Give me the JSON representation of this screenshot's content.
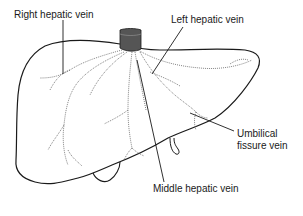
{
  "diagram": {
    "labels": {
      "right_hepatic_vein": "Right hepatic vein",
      "left_hepatic_vein": "Left hepatic vein",
      "umbilical_fissure_vein_line1": "Umbilical",
      "umbilical_fissure_vein_line2": "fissure vein",
      "middle_hepatic_vein": "Middle hepatic vein"
    },
    "colors": {
      "outline": "#1a1a1a",
      "vessel_dotted": "#666666",
      "ivc": "#555555",
      "background": "#ffffff"
    }
  }
}
